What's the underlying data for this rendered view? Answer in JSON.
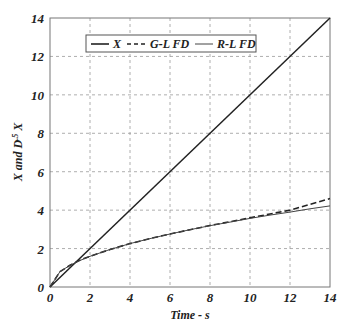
{
  "chart_data": {
    "type": "line",
    "title": "",
    "xlabel": "Time - s",
    "ylabel": "X and D^.5 X",
    "ylabel_parts": {
      "pre": "X and D",
      "sup": ".5",
      "post": " X"
    },
    "xlim": [
      0,
      14
    ],
    "ylim": [
      0,
      14
    ],
    "xticks": [
      "0",
      "2",
      "4",
      "6",
      "8",
      "10",
      "12",
      "14"
    ],
    "yticks": [
      "0",
      "2",
      "4",
      "6",
      "8",
      "10",
      "12",
      "14"
    ],
    "grid": true,
    "legend_position": "top (inside)",
    "legend": [
      "X",
      "G-L FD",
      "R-L FD"
    ],
    "series": [
      {
        "name": "X",
        "style": "solid",
        "x": [
          0,
          14
        ],
        "y": [
          0,
          14
        ]
      },
      {
        "name": "G-L FD",
        "style": "dashed",
        "x": [
          0,
          0.5,
          1,
          1.5,
          2,
          3,
          4,
          5,
          6,
          7,
          8,
          9,
          10,
          11,
          12,
          13,
          14
        ],
        "y": [
          0,
          0.8,
          1.13,
          1.4,
          1.6,
          1.95,
          2.26,
          2.52,
          2.76,
          2.98,
          3.2,
          3.4,
          3.6,
          3.8,
          4.0,
          4.3,
          4.6
        ]
      },
      {
        "name": "R-L FD",
        "style": "solid-thin",
        "x": [
          0,
          0.5,
          1,
          1.5,
          2,
          3,
          4,
          5,
          6,
          7,
          8,
          9,
          10,
          11,
          12,
          13,
          14
        ],
        "y": [
          0,
          0.8,
          1.13,
          1.38,
          1.6,
          1.95,
          2.26,
          2.52,
          2.76,
          2.98,
          3.19,
          3.38,
          3.57,
          3.74,
          3.9,
          4.07,
          4.22
        ]
      }
    ]
  }
}
